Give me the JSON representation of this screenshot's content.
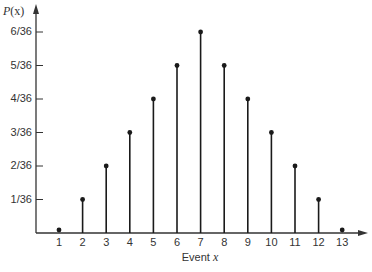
{
  "chart_data": {
    "type": "bar",
    "style": "stem (lollipop) plot",
    "title": "",
    "xlabel": "Event x",
    "ylabel": "P(x)",
    "categories": [
      1,
      2,
      3,
      4,
      5,
      6,
      7,
      8,
      9,
      10,
      11,
      12,
      13
    ],
    "values_over_36": [
      0,
      1,
      2,
      3,
      4,
      5,
      6,
      5,
      4,
      3,
      2,
      1,
      0
    ],
    "values": [
      0,
      0.0278,
      0.0556,
      0.0833,
      0.1111,
      0.1389,
      0.1667,
      0.1389,
      0.1111,
      0.0833,
      0.0556,
      0.0278,
      0
    ],
    "y_tick_labels": [
      "1/36",
      "2/36",
      "3/36",
      "4/36",
      "5/36",
      "6/36"
    ],
    "x_tick_labels": [
      "1",
      "2",
      "3",
      "4",
      "5",
      "6",
      "7",
      "8",
      "9",
      "10",
      "11",
      "12",
      "13"
    ],
    "ylim": [
      0,
      0.1667
    ],
    "grid": false,
    "legend": null
  },
  "labels": {
    "y_axis_title_prefix": "P",
    "y_axis_title_arg": "(x)",
    "x_axis_title_text": "Event ",
    "x_axis_title_var": "x"
  },
  "colors": {
    "stem": "#1a1a1a",
    "axis": "#333333",
    "background": "#ffffff"
  }
}
